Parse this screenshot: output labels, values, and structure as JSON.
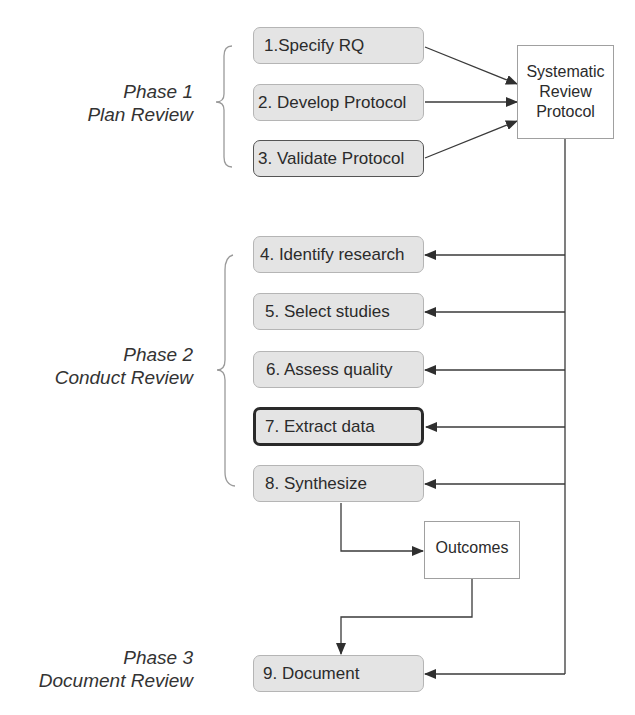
{
  "title_cut_off": "Systematic Review Process",
  "phases": [
    {
      "label": "Phase 1",
      "sublabel": "Plan Review"
    },
    {
      "label": "Phase 2",
      "sublabel": "Conduct Review"
    },
    {
      "label": "Phase 3",
      "sublabel": "Document Review"
    }
  ],
  "steps": [
    {
      "id": 1,
      "label": "1.Specify RQ",
      "phase": 1,
      "style": "normal"
    },
    {
      "id": 2,
      "label": "2. Develop Protocol",
      "phase": 1,
      "style": "normal"
    },
    {
      "id": 3,
      "label": "3. Validate Protocol",
      "phase": 1,
      "style": "dark-border"
    },
    {
      "id": 4,
      "label": "4. Identify research",
      "phase": 2,
      "style": "normal"
    },
    {
      "id": 5,
      "label": "5. Select studies",
      "phase": 2,
      "style": "normal"
    },
    {
      "id": 6,
      "label": "6. Assess quality",
      "phase": 2,
      "style": "normal"
    },
    {
      "id": 7,
      "label": "7. Extract data",
      "phase": 2,
      "style": "highlighted"
    },
    {
      "id": 8,
      "label": "8. Synthesize",
      "phase": 2,
      "style": "normal"
    },
    {
      "id": 9,
      "label": "9. Document",
      "phase": 3,
      "style": "normal"
    }
  ],
  "documents": {
    "protocol": {
      "line1": "Systematic",
      "line2": "Review",
      "line3": "Protocol"
    },
    "outcomes": {
      "label": "Outcomes"
    }
  },
  "edges": [
    {
      "from": "1.Specify RQ",
      "to": "Systematic Review Protocol"
    },
    {
      "from": "2. Develop Protocol",
      "to": "Systematic Review Protocol"
    },
    {
      "from": "3. Validate Protocol",
      "to": "Systematic Review Protocol"
    },
    {
      "from": "Systematic Review Protocol",
      "to": "4. Identify research"
    },
    {
      "from": "Systematic Review Protocol",
      "to": "5. Select studies"
    },
    {
      "from": "Systematic Review Protocol",
      "to": "6. Assess quality"
    },
    {
      "from": "Systematic Review Protocol",
      "to": "7. Extract data"
    },
    {
      "from": "Systematic Review Protocol",
      "to": "8. Synthesize"
    },
    {
      "from": "Systematic Review Protocol",
      "to": "9. Document"
    },
    {
      "from": "8. Synthesize",
      "to": "Outcomes"
    },
    {
      "from": "Outcomes",
      "to": "9. Document"
    }
  ],
  "colors": {
    "box_fill": "#e4e4e4",
    "box_border": "#b5b5b5",
    "line": "#3a3a3a",
    "text": "#2b2b2b"
  }
}
